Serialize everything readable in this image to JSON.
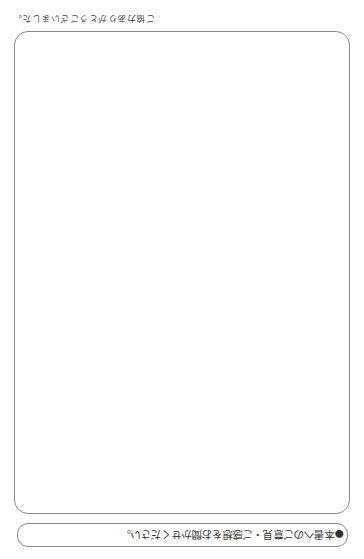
{
  "document": {
    "orientation": "upside-down (rotated 180°)",
    "prompt": {
      "bullet": "●",
      "text": "本書へのご意見・ご感想をお聞かせください。"
    },
    "answer_area": {
      "content": ""
    },
    "closing": {
      "text": "ご協力ありがとうございました。"
    }
  }
}
